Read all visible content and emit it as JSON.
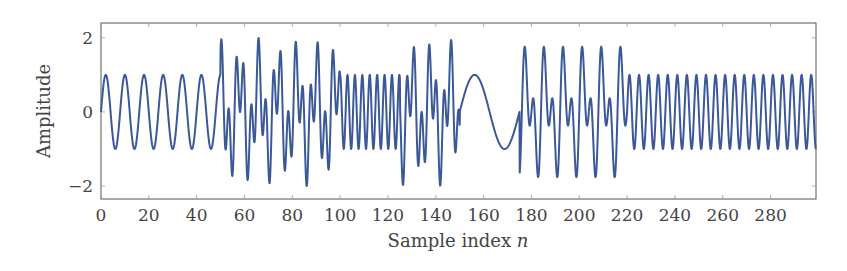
{
  "chart_data": {
    "type": "line",
    "title": "",
    "xlabel": "Sample index n",
    "xlabel_text": "Sample index ",
    "xlabel_var": "n",
    "ylabel": "Amplitude",
    "xlim": [
      0,
      299
    ],
    "ylim": [
      -2.35,
      2.4
    ],
    "grid": false,
    "legend": null,
    "line_color": "#3b5998",
    "x_ticks": [
      0,
      20,
      40,
      60,
      80,
      100,
      120,
      140,
      160,
      180,
      200,
      220,
      240,
      260,
      280
    ],
    "x_tick_labels": [
      "0",
      "20",
      "40",
      "60",
      "80",
      "100",
      "120",
      "140",
      "160",
      "180",
      "200",
      "220",
      "240",
      "260",
      "280"
    ],
    "y_ticks": [
      2,
      0,
      -2
    ],
    "y_tick_labels": [
      "2",
      "0",
      "−2"
    ],
    "segments": [
      {
        "from": 0,
        "to": 50,
        "components": [
          {
            "amp": 1,
            "period": 8
          }
        ]
      },
      {
        "from": 50,
        "to": 100,
        "components": [
          {
            "amp": 1,
            "period": 8
          },
          {
            "amp": 1,
            "period": 3.1
          }
        ]
      },
      {
        "from": 100,
        "to": 125,
        "components": [
          {
            "amp": 1,
            "period": 3.1
          }
        ]
      },
      {
        "from": 125,
        "to": 150,
        "components": [
          {
            "amp": 1,
            "period": 3.1
          },
          {
            "amp": 1,
            "period": 8
          }
        ]
      },
      {
        "from": 150,
        "to": 175,
        "components": [
          {
            "amp": 1,
            "period": 25
          }
        ]
      },
      {
        "from": 175,
        "to": 220,
        "components": [
          {
            "amp": 1,
            "period": 8
          },
          {
            "amp": 1,
            "period": 4
          }
        ]
      },
      {
        "from": 220,
        "to": 300,
        "components": [
          {
            "amp": 1,
            "period": 4
          }
        ]
      }
    ],
    "series": [
      {
        "name": "signal",
        "description": "Piecewise sinusoidal test signal: single tone (period 8) for n<50, two-tone mixtures (amplitude up to ~2) on 50–100, 125–150 and 175–220, fast tone (period ~3) on 100–125, slow tone (period ~25) on 150–175, fast tone (period 4) on 220–299."
      }
    ]
  }
}
